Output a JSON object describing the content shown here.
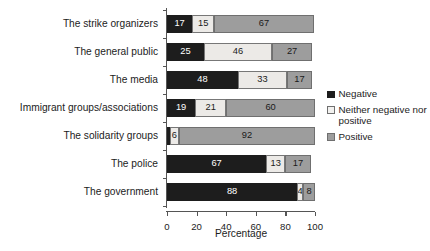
{
  "chart_data": {
    "type": "bar",
    "subtype": "stacked-horizontal-bar",
    "title": "",
    "xlabel": "Percentage",
    "ylabel": "",
    "xlim": [
      0,
      100
    ],
    "xticks": [
      0,
      20,
      40,
      60,
      80,
      100
    ],
    "grid": false,
    "legend_position": "right",
    "categories": [
      "The strike organizers",
      "The general public",
      "The media",
      "Immigrant groups/associations",
      "The solidarity groups",
      "The police",
      "The government"
    ],
    "series": [
      {
        "name": "Negative",
        "color": "#1d1d1d",
        "values": [
          17,
          25,
          48,
          19,
          2,
          67,
          88
        ],
        "labels": [
          "17",
          "25",
          "48",
          "19",
          "",
          "67",
          "88"
        ]
      },
      {
        "name": "Neither negative nor positive",
        "color": "#eceae7",
        "values": [
          15,
          46,
          33,
          21,
          6,
          13,
          4
        ],
        "labels": [
          "15",
          "46",
          "33",
          "21",
          "6",
          "13",
          "4"
        ]
      },
      {
        "name": "Positive",
        "color": "#9d9d9d",
        "values": [
          67,
          27,
          17,
          60,
          92,
          17,
          8
        ],
        "labels": [
          "67",
          "27",
          "17",
          "60",
          "92",
          "17",
          "8"
        ]
      }
    ]
  },
  "legend": {
    "items": [
      {
        "label": "Negative",
        "swatch": "sw-negative"
      },
      {
        "label": "Neither negative nor positive",
        "swatch": "sw-neutral"
      },
      {
        "label": "Positive",
        "swatch": "sw-positive"
      }
    ]
  },
  "axis": {
    "x_title": "Percentage"
  }
}
